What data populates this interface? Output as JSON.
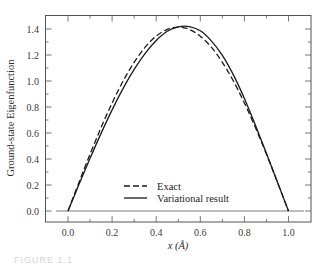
{
  "chart_data": {
    "type": "line",
    "title": "",
    "xlabel": "x (Å)",
    "ylabel": "Ground-state Eigenfunction",
    "xlim": [
      -0.105,
      1.1
    ],
    "ylim": [
      -0.085,
      1.503
    ],
    "xticks": [
      0.0,
      0.2,
      0.4,
      0.6,
      0.8,
      1.0
    ],
    "xtick_labels": [
      "0.0",
      "0.2",
      "0.4",
      "0.6",
      "0.8",
      "1.0"
    ],
    "yticks": [
      0.0,
      0.2,
      0.4,
      0.6,
      0.8,
      1.0,
      1.2,
      1.4
    ],
    "ytick_labels": [
      "0.0",
      "0.2",
      "0.4",
      "0.6",
      "0.8",
      "1.0",
      "1.2",
      "1.4"
    ],
    "grid": false,
    "zero_line": true,
    "legend_position": "lower center",
    "x": [
      0.0,
      0.05,
      0.1,
      0.15,
      0.2,
      0.25,
      0.3,
      0.35,
      0.4,
      0.45,
      0.5,
      0.55,
      0.6,
      0.65,
      0.7,
      0.75,
      0.8,
      0.85,
      0.9,
      0.95,
      1.0
    ],
    "series": [
      {
        "name": "Exact",
        "style": "dashed",
        "values": [
          0.0,
          0.221,
          0.437,
          0.642,
          0.831,
          1.0,
          1.144,
          1.26,
          1.345,
          1.397,
          1.414,
          1.397,
          1.345,
          1.26,
          1.144,
          1.0,
          0.831,
          0.642,
          0.437,
          0.221,
          0.0
        ]
      },
      {
        "name": "Variational result",
        "style": "solid",
        "values": [
          0.0,
          0.205,
          0.405,
          0.597,
          0.778,
          0.943,
          1.089,
          1.213,
          1.312,
          1.383,
          1.417,
          1.419,
          1.386,
          1.309,
          1.197,
          1.047,
          0.866,
          0.66,
          0.443,
          0.221,
          0.0
        ]
      }
    ]
  },
  "caption": "FIGURE 1.1"
}
